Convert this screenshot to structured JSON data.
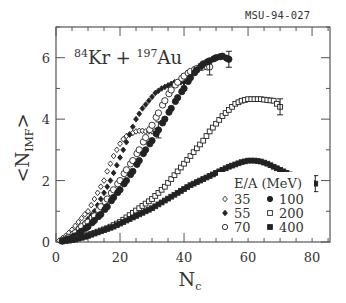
{
  "figure_id": "MSU-94-027",
  "chart_data": {
    "type": "scatter",
    "title": "84Kr + 197Au",
    "reaction": {
      "projectile_mass": "84",
      "projectile": "Kr",
      "operator": "+",
      "target_mass": "197",
      "target": "Au"
    },
    "xlabel": "N_c",
    "xlabel_main": "N",
    "xlabel_sub": "c",
    "ylabel": "<N_IMF>",
    "ylabel_main": "N",
    "ylabel_sub": "IMF",
    "xlim": [
      0,
      85.6
    ],
    "ylim": [
      0,
      7
    ],
    "xticks": [
      0,
      20,
      40,
      60,
      80
    ],
    "xtick_labels": [
      "0",
      "20",
      "40",
      "60",
      "80"
    ],
    "yticks": [
      0,
      2,
      4,
      6
    ],
    "ytick_labels": [
      "0",
      "2",
      "4",
      "6"
    ],
    "x_minor_step": 5,
    "y_minor_step": 1,
    "grid": false,
    "legend": {
      "title": "E/A (MeV)",
      "position": "lower right",
      "columns": 2
    },
    "series": [
      {
        "name": "35",
        "marker": "open-diamond",
        "x": [
          1,
          3,
          5,
          7,
          9,
          10,
          11,
          12,
          13,
          14,
          15,
          16,
          17,
          18,
          19,
          20,
          21,
          22,
          23,
          24,
          25,
          26,
          27,
          28,
          29,
          30,
          31,
          32
        ],
        "y": [
          0.05,
          0.2,
          0.4,
          0.65,
          0.9,
          1.0,
          1.2,
          1.4,
          1.6,
          1.8,
          2.0,
          2.3,
          2.55,
          2.8,
          3.0,
          3.2,
          3.35,
          3.45,
          3.5,
          3.55,
          3.6,
          3.62,
          3.62,
          3.6,
          3.6,
          3.6,
          3.62,
          3.65
        ]
      },
      {
        "name": "55",
        "marker": "filled-diamond",
        "x": [
          2,
          4,
          6,
          8,
          10,
          12,
          14,
          16,
          17,
          19,
          21,
          23,
          25,
          27,
          29,
          31,
          33,
          35,
          37,
          39,
          40
        ],
        "y": [
          0.05,
          0.15,
          0.3,
          0.5,
          0.75,
          1.0,
          1.4,
          1.8,
          2.0,
          2.5,
          3.0,
          3.5,
          4.0,
          4.35,
          4.6,
          4.85,
          5.0,
          5.1,
          5.2,
          5.2,
          5.2
        ]
      },
      {
        "name": "70",
        "marker": "open-circle",
        "x": [
          2,
          4,
          6,
          8,
          10,
          12,
          14,
          16,
          18,
          20,
          22,
          24,
          26,
          28,
          30,
          32,
          34,
          36,
          38,
          40,
          42,
          44,
          46,
          48
        ],
        "y": [
          0.05,
          0.15,
          0.3,
          0.5,
          0.65,
          0.85,
          1.15,
          1.4,
          1.7,
          2.0,
          2.35,
          2.65,
          3.0,
          3.4,
          3.8,
          4.2,
          4.6,
          4.95,
          5.2,
          5.4,
          5.55,
          5.65,
          5.7,
          5.7
        ]
      },
      {
        "name": "100",
        "marker": "filled-circle",
        "x": [
          2,
          4,
          6,
          8,
          10,
          12,
          14,
          16,
          18,
          20,
          22,
          24,
          26,
          28,
          30,
          32,
          34,
          36,
          38,
          40,
          42,
          44,
          46,
          48,
          50,
          52,
          54
        ],
        "y": [
          0.03,
          0.1,
          0.2,
          0.35,
          0.5,
          0.7,
          0.9,
          1.15,
          1.45,
          1.7,
          2.0,
          2.3,
          2.65,
          3.0,
          3.3,
          3.65,
          4.0,
          4.35,
          4.7,
          5.0,
          5.35,
          5.6,
          5.8,
          5.9,
          6.0,
          6.05,
          5.95
        ]
      },
      {
        "name": "200",
        "marker": "open-square",
        "x": [
          4,
          8,
          12,
          16,
          18,
          20,
          22,
          24,
          26,
          28,
          30,
          32,
          34,
          36,
          38,
          40,
          42,
          44,
          46,
          48,
          50,
          52,
          54,
          56,
          58,
          60,
          62,
          64,
          66,
          68,
          70
        ],
        "y": [
          0.05,
          0.15,
          0.3,
          0.45,
          0.55,
          0.65,
          0.8,
          0.95,
          1.1,
          1.25,
          1.4,
          1.6,
          1.8,
          2.05,
          2.3,
          2.55,
          2.8,
          3.05,
          3.3,
          3.6,
          3.85,
          4.1,
          4.3,
          4.5,
          4.6,
          4.65,
          4.65,
          4.65,
          4.62,
          4.6,
          4.4
        ]
      },
      {
        "name": "400",
        "marker": "filled-square",
        "x": [
          2,
          6,
          10,
          14,
          18,
          22,
          26,
          30,
          34,
          38,
          42,
          46,
          50,
          54,
          58,
          60,
          62,
          64,
          66,
          68,
          70,
          72,
          74,
          76,
          78,
          80,
          81
        ],
        "y": [
          0.02,
          0.08,
          0.2,
          0.35,
          0.5,
          0.7,
          0.9,
          1.1,
          1.35,
          1.6,
          1.85,
          2.05,
          2.25,
          2.45,
          2.6,
          2.65,
          2.65,
          2.62,
          2.55,
          2.45,
          2.35,
          2.25,
          2.15,
          2.05,
          1.98,
          1.92,
          1.9
        ]
      }
    ]
  }
}
